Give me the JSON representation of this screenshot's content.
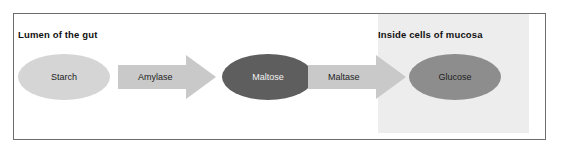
{
  "figure": {
    "type": "process-flow-diagram",
    "title_visible": false,
    "compartments": [
      {
        "id": "lumen",
        "heading": "Lumen of the gut",
        "shaded": false
      },
      {
        "id": "mucosa",
        "heading": "Inside cells of mucosa",
        "shaded": true,
        "background_color": "#ededed"
      }
    ],
    "molecules": [
      {
        "id": "starch",
        "label": "Starch",
        "fill": "#d5d5d5",
        "text_color": "#1d1d1d",
        "compartment": "lumen"
      },
      {
        "id": "maltose",
        "label": "Maltose",
        "fill": "#5e5e5e",
        "text_color": "#f2f2f2",
        "compartment": "lumen"
      },
      {
        "id": "glucose",
        "label": "Glucose",
        "fill": "#8d8d8d",
        "text_color": "#1d1d1d",
        "compartment": "mucosa"
      }
    ],
    "enzymes": [
      {
        "id": "amylase",
        "label": "Amylase",
        "from": "Starch",
        "to": "Maltose",
        "fill": "#c9c9c9"
      },
      {
        "id": "maltase",
        "label": "Maltase",
        "from": "Maltose",
        "to": "Glucose",
        "fill": "#c9c9c9"
      }
    ],
    "border_color": "#6d6d6d",
    "background_color": "#ffffff"
  }
}
